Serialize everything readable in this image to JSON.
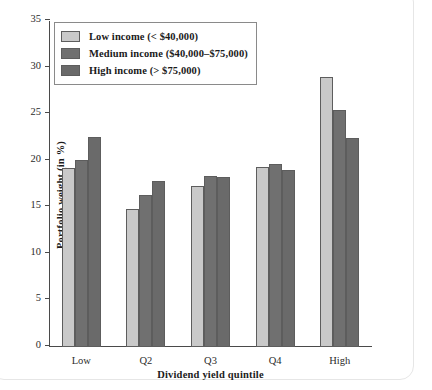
{
  "chart_data": {
    "type": "bar",
    "title": "",
    "xlabel": "Dividend yield quintile",
    "ylabel": "Portfolio weight (in %)",
    "categories": [
      "Low",
      "Q2",
      "Q3",
      "Q4",
      "High"
    ],
    "series": [
      {
        "name": "Low income (< $40,000)",
        "color": "#c9c9c9",
        "values": [
          19.2,
          14.85,
          17.3,
          19.35,
          29.0
        ]
      },
      {
        "name": "Medium income ($40,000–$75,000)",
        "color": "#707070",
        "values": [
          20.1,
          16.3,
          18.35,
          19.65,
          25.45
        ]
      },
      {
        "name": "High income (> $75,000)",
        "color": "#6a6a6a",
        "values": [
          22.5,
          17.8,
          18.2,
          19.05,
          22.4
        ]
      }
    ],
    "ylim": [
      0,
      35
    ],
    "yticks": [
      0,
      5,
      10,
      15,
      20,
      25,
      30,
      35
    ],
    "ytick_labels": [
      "0",
      "5",
      "10",
      "15",
      "20",
      "25",
      "30",
      "35"
    ],
    "grid": false,
    "legend_position": "top-left"
  },
  "legend": {
    "items": [
      {
        "label": "Low income (< $40,000)"
      },
      {
        "label": "Medium income ($40,000–$75,000)"
      },
      {
        "label": "High income (> $75,000)"
      }
    ]
  },
  "axes": {
    "y_title": "Portfolio weight (in %)",
    "x_title": "Dividend yield quintile"
  }
}
